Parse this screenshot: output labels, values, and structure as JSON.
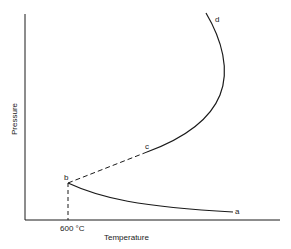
{
  "diagram": {
    "type": "phase-diagram",
    "axes": {
      "x_label": "Temperature",
      "y_label": "Pressure",
      "x_tick_label": "600 °C"
    },
    "points": {
      "a": "a",
      "b": "b",
      "c": "c",
      "d": "d"
    },
    "segments": [
      {
        "from": "b",
        "to": "a",
        "style": "solid"
      },
      {
        "from": "b",
        "to": "c",
        "style": "dashed"
      },
      {
        "from": "c",
        "to": "d",
        "style": "solid"
      },
      {
        "from": "b",
        "to": "x-axis",
        "style": "dashed",
        "at": "600 °C"
      }
    ],
    "colors": {
      "line": "#1a1a1a",
      "background": "#ffffff"
    }
  }
}
